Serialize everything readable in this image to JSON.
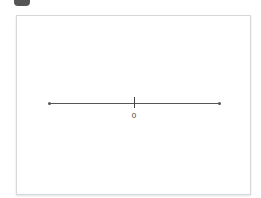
{
  "number_line": {
    "min_visible": null,
    "ticks": [
      {
        "value": 0,
        "label": "0"
      }
    ],
    "colors": {
      "axis": "#555555",
      "panel_border": "#d8d8d8"
    }
  }
}
